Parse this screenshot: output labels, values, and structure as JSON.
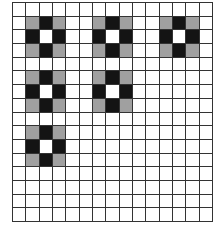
{
  "grid": {
    "cols": 15,
    "rows": 16,
    "colors": {
      "white": "#ffffff",
      "gray": "#a0a0a0",
      "black": "#141414",
      "line": "#333333"
    },
    "motif": [
      [
        "g",
        "b",
        "g"
      ],
      [
        "b",
        "w",
        "b"
      ],
      [
        "g",
        "b",
        "g"
      ]
    ],
    "motif_positions": [
      {
        "col": 1,
        "row": 1
      },
      {
        "col": 6,
        "row": 1
      },
      {
        "col": 11,
        "row": 1
      },
      {
        "col": 1,
        "row": 5
      },
      {
        "col": 6,
        "row": 5
      },
      {
        "col": 1,
        "row": 9
      }
    ]
  }
}
